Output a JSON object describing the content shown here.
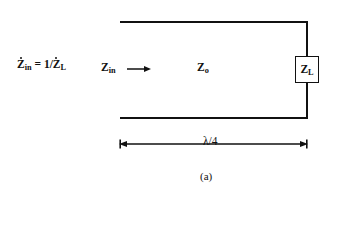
{
  "figure": {
    "caption": "(a)",
    "background_color": "#ffffff",
    "line_color": "#111111"
  },
  "labels": {
    "input_relation_z": "Z",
    "input_relation_sub_in": "in",
    "input_relation_eq": " = 1/",
    "input_relation_z2": "Z",
    "input_relation_sub_l": "L",
    "zin_z": "Z",
    "zin_sub": "in",
    "zo_z": "Z",
    "zo_sub": "o",
    "zl_z": "Z",
    "zl_sub": "L",
    "length": "λ/4"
  },
  "icons": {
    "direction_arrow": "right-arrow-icon",
    "dimension_arrow": "double-headed-dimension-arrow-icon"
  },
  "geometry": {
    "line_left_x": 120,
    "line_right_x": 307,
    "conductor_top_y": 22,
    "conductor_bottom_y": 118,
    "dimension_y": 144,
    "load_box_cx": 307,
    "load_box_cy": 70
  }
}
